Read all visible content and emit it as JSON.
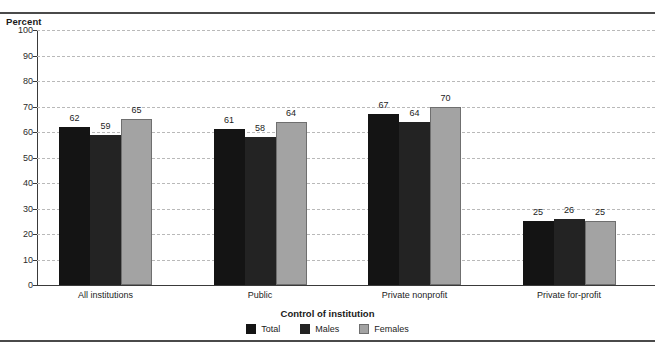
{
  "figure": {
    "y_axis_title": "Percent",
    "x_axis_title": "Control of institution",
    "cut_off_top_text": ""
  },
  "legend": {
    "position": "bottom-center",
    "items": [
      {
        "label": "Total",
        "color": "#141414",
        "key": "total"
      },
      {
        "label": "Males",
        "color": "#232323",
        "key": "males"
      },
      {
        "label": "Females",
        "color": "#a3a3a3",
        "key": "females"
      }
    ]
  },
  "chart_data": {
    "type": "bar",
    "title": "",
    "xlabel": "Control of institution",
    "ylabel": "Percent",
    "ylim": [
      0,
      100
    ],
    "yticks": [
      0,
      10,
      20,
      30,
      40,
      50,
      60,
      70,
      80,
      90,
      100
    ],
    "grid": true,
    "legend_position": "bottom-center",
    "categories": [
      "All institutions",
      "Public",
      "Private nonprofit",
      "Private for-profit"
    ],
    "series": [
      {
        "name": "Total",
        "color": "#141414",
        "values": [
          62,
          61,
          67,
          25
        ]
      },
      {
        "name": "Males",
        "color": "#232323",
        "values": [
          59,
          58,
          64,
          26
        ]
      },
      {
        "name": "Females",
        "color": "#a3a3a3",
        "values": [
          65,
          64,
          70,
          25
        ]
      }
    ]
  }
}
